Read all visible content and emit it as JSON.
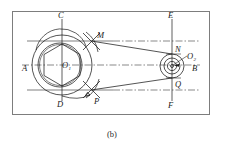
{
  "figure": {
    "caption": "(b)",
    "type": "engineering-construction-drawing",
    "border_color": "#7d7d7d",
    "line_color": "#1b1b1b",
    "background": "#ffffff"
  },
  "labels": {
    "a": "A",
    "b": "B",
    "c": "C",
    "d": "D",
    "e": "E",
    "f": "F",
    "m": "M",
    "n": "N",
    "p": "P",
    "q": "Q",
    "o1": "O",
    "o1_sub": "1",
    "o2": "O",
    "o2_sub": "2"
  },
  "geometry": {
    "left_pulley": {
      "center_x": 62,
      "center_y": 65,
      "outer_radius": 30,
      "inner_radius": 22,
      "inner_radius_2": 21,
      "polygon_sides": 6
    },
    "right_pulley": {
      "center_x": 172,
      "center_y": 66,
      "outer_radius": 12,
      "mid_radius": 8,
      "inner_radius": 4.5,
      "hub_radius": 1.6
    },
    "construction_arcs": [
      {
        "name": "arc-through-M-P",
        "center_x": 62,
        "center_y": 65,
        "radius": 30
      },
      {
        "name": "arc-upper-left",
        "center_x": 58,
        "center_y": 56,
        "radius": 26
      }
    ],
    "axes": {
      "horizontal_centerline_y": 65,
      "vertical_left_x": 62,
      "vertical_right_x": 172,
      "upper_tangent_y": 41,
      "lower_tangent_y": 90
    },
    "border": {
      "x": 12,
      "y": 11,
      "width": 198,
      "height": 104
    }
  }
}
